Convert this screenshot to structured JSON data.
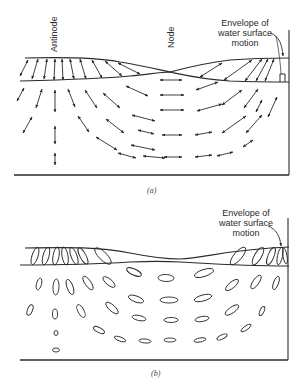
{
  "figure": {
    "panel_a": {
      "caption": "(a)",
      "labels": {
        "antinode": "Antinode",
        "node": "Node",
        "envelope_line1": "Envelope of",
        "envelope_line2": "water surface",
        "envelope_line3": "motion"
      },
      "particle_motion": "double-headed arrows"
    },
    "panel_b": {
      "caption": "(b)",
      "labels": {
        "envelope_line1": "Envelope of",
        "envelope_line2": "water surface",
        "envelope_line3": "motion"
      },
      "particle_motion": "ellipses"
    },
    "colors": {
      "ink": "#2a2a2a",
      "background": "#ffffff"
    }
  }
}
